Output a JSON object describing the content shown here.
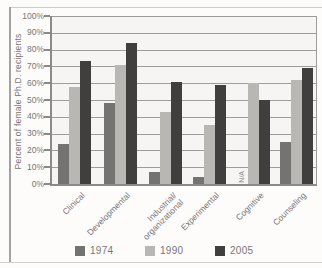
{
  "chart_data": {
    "type": "bar",
    "title": "",
    "ylabel": "Percent of female Ph.D. recipients",
    "xlabel": "",
    "categories": [
      "Clinical",
      "Developmental",
      "Industrial/\norganizational",
      "Experimental",
      "Cognitive",
      "Counseling"
    ],
    "series": [
      {
        "name": "1974",
        "color": "#757371",
        "values": [
          24,
          48,
          7,
          4,
          null,
          25
        ]
      },
      {
        "name": "1990",
        "color": "#b9b7b4",
        "values": [
          58,
          71,
          43,
          35,
          60,
          62
        ]
      },
      {
        "name": "2005",
        "color": "#403f3d",
        "values": [
          73,
          84,
          61,
          59,
          50,
          69
        ]
      }
    ],
    "missing_value_label": "N/A",
    "ylim": [
      0,
      100
    ],
    "ytick_step": 10,
    "ytick_labels": [
      "0%",
      "10%",
      "20%",
      "30%",
      "40%",
      "50%",
      "60%",
      "70%",
      "80%",
      "90%",
      "100%"
    ],
    "grid": true,
    "legend_position": "bottom",
    "legend_labels": [
      "1974",
      "1990",
      "2005"
    ]
  },
  "colors": {
    "axis": "#8b8a88",
    "gridline": "#9d9c9a",
    "text": "#77767a",
    "plot_background": "#f6f5f3",
    "page_background": "#fdfcfa",
    "frame": "#cfcecc"
  }
}
